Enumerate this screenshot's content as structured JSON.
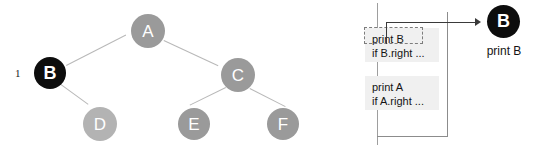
{
  "figure": {
    "step_label": "1",
    "colors": {
      "node_gray": "#9a9a9a",
      "node_light": "#b3b3b3",
      "node_active": "#0d0d0d",
      "edge": "#b8b8b8",
      "frame_bg": "#f0f0f0",
      "arrow": "#3a3a3a",
      "divider": "#9e9e9e",
      "highlight_border": "#7d7d7d"
    }
  },
  "tree": {
    "nodes": [
      {
        "id": "A",
        "label": "A",
        "state": "visited",
        "cx": 148,
        "cy": 31,
        "r": 17
      },
      {
        "id": "B",
        "label": "B",
        "state": "current",
        "cx": 50,
        "cy": 73,
        "r": 16
      },
      {
        "id": "C",
        "label": "C",
        "state": "visited",
        "cx": 238,
        "cy": 75,
        "r": 17
      },
      {
        "id": "D",
        "label": "D",
        "state": "unvisited",
        "cx": 100,
        "cy": 124,
        "r": 17
      },
      {
        "id": "E",
        "label": "E",
        "state": "unvisited",
        "cx": 194,
        "cy": 124,
        "r": 16
      },
      {
        "id": "F",
        "label": "F",
        "state": "unvisited",
        "cx": 283,
        "cy": 124,
        "r": 16
      }
    ],
    "edges": [
      {
        "from": "A",
        "to": "B"
      },
      {
        "from": "A",
        "to": "C"
      },
      {
        "from": "B",
        "to": "D"
      },
      {
        "from": "C",
        "to": "E"
      },
      {
        "from": "C",
        "to": "F"
      }
    ]
  },
  "stack": {
    "frames": [
      {
        "line1": "print B",
        "line2": "if B.right ...",
        "highlighted_line": "print B"
      },
      {
        "line1": "print A",
        "line2": "if A.right ..."
      }
    ]
  },
  "output": {
    "node_label": "B",
    "caption": "print B"
  }
}
